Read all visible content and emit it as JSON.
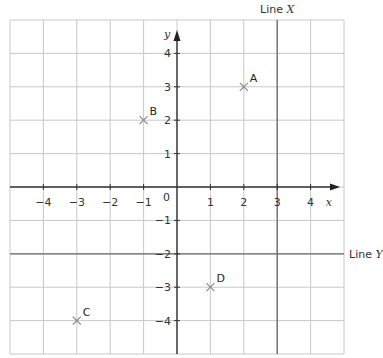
{
  "diagram": {
    "type": "coordinate-grid",
    "x_range": [
      -5,
      5
    ],
    "y_range": [
      -5,
      5
    ],
    "x_axis_label": "x",
    "y_axis_label": "y",
    "origin_label": "0",
    "x_ticks": [
      "-4",
      "-3",
      "-2",
      "-1",
      "1",
      "2",
      "3",
      "4"
    ],
    "y_ticks": [
      "4",
      "3",
      "2",
      "1",
      "-1",
      "-2",
      "-3",
      "-4"
    ],
    "lines": [
      {
        "name": "Line X",
        "prefix": "Line",
        "var": "X",
        "equation": "x = 3"
      },
      {
        "name": "Line Y",
        "prefix": "Line",
        "var": "Y",
        "equation": "y = -2"
      }
    ],
    "points": [
      {
        "label": "A",
        "x": 2,
        "y": 3
      },
      {
        "label": "B",
        "x": -1,
        "y": 2
      },
      {
        "label": "C",
        "x": -3,
        "y": -4
      },
      {
        "label": "D",
        "x": 1,
        "y": -3
      }
    ]
  },
  "colors": {
    "grid": "#c8c8c8",
    "axis": "#333333",
    "special_line": "#6a6a6a",
    "point_marker": "#888888"
  }
}
